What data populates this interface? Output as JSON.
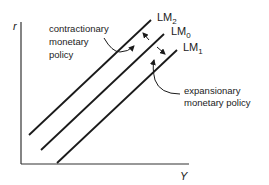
{
  "diagram": {
    "axes": {
      "y_label": "r",
      "x_label": "Y"
    },
    "curves": [
      {
        "id": "LM2",
        "base": "LM",
        "sub": "2"
      },
      {
        "id": "LM0",
        "base": "LM",
        "sub": "0"
      },
      {
        "id": "LM1",
        "base": "LM",
        "sub": "1"
      }
    ],
    "annotations": {
      "contractionary": [
        "contractionary",
        "monetary",
        "policy"
      ],
      "expansionary": [
        "expansionary",
        "monetary policy"
      ]
    },
    "colors": {
      "line": "#1a1a1a",
      "background": "#ffffff"
    }
  }
}
